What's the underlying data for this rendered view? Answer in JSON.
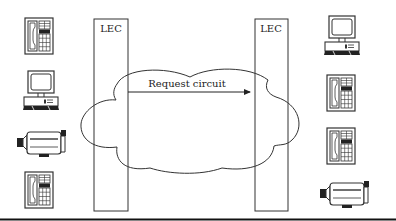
{
  "diagram": {
    "left_switch": {
      "label": "LEC"
    },
    "right_switch": {
      "label": "LEC"
    },
    "network_cloud": {
      "message": "Request circuit"
    },
    "left_devices": [
      "telephone",
      "computer",
      "video-camera",
      "telephone"
    ],
    "right_devices": [
      "computer",
      "telephone",
      "telephone",
      "video-camera"
    ]
  }
}
